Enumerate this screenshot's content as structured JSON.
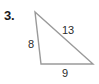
{
  "figure": {
    "problem_number": "3.",
    "shape": "triangle",
    "stroke_color": "#9a9a9a",
    "label_color": "#2b2b2b",
    "background_color": "#ffffff",
    "vertices": {
      "apex": {
        "x": 35,
        "y": 12
      },
      "bottom_left": {
        "x": 41,
        "y": 64
      },
      "bottom_right": {
        "x": 93,
        "y": 64
      }
    },
    "sides": [
      {
        "name": "leg-a",
        "label": "8",
        "position": "left"
      },
      {
        "name": "hypotenuse",
        "label": "13",
        "position": "upper-right"
      },
      {
        "name": "leg-b",
        "label": "9",
        "position": "bottom"
      }
    ],
    "labels": {
      "leg_a": "8",
      "hypotenuse": "13",
      "leg_b": "9"
    }
  }
}
